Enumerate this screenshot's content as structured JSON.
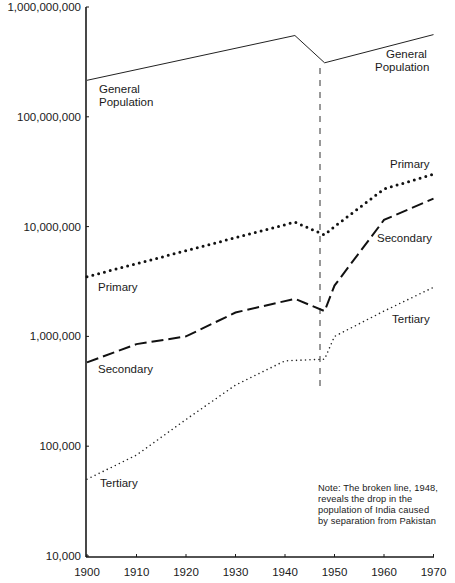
{
  "chart_data": {
    "type": "line",
    "title": "",
    "xlabel": "",
    "ylabel": "",
    "yscale": "log",
    "ylim": [
      10000,
      1000000000
    ],
    "xlim": [
      1900,
      1970
    ],
    "grid": false,
    "legend": "inline labels",
    "x_ticks": [
      "1900",
      "1910",
      "1920",
      "1930",
      "1940",
      "1950",
      "1960",
      "1970"
    ],
    "y_ticks": [
      "1,000,000,000",
      "100,000,000",
      "10,000,000",
      "1,000,000",
      "100,000",
      "10,000"
    ],
    "series": [
      {
        "name": "General Population",
        "style": "solid",
        "x": [
          1900,
          1942,
          1948,
          1970
        ],
        "values": [
          215000000,
          550000000,
          310000000,
          560000000
        ]
      },
      {
        "name": "Primary",
        "style": "dotted-heavy",
        "x": [
          1900,
          1942,
          1948,
          1950,
          1960,
          1970
        ],
        "values": [
          3500000,
          11000000,
          8400000,
          10000000,
          22000000,
          30000000
        ]
      },
      {
        "name": "Secondary",
        "style": "dashed",
        "x": [
          1900,
          1910,
          1920,
          1930,
          1942,
          1948,
          1950,
          1960,
          1970
        ],
        "values": [
          580000,
          850000,
          1000000,
          1650000,
          2200000,
          1700000,
          2900000,
          11500000,
          18000000
        ]
      },
      {
        "name": "Tertiary",
        "style": "dotted-light",
        "x": [
          1900,
          1910,
          1920,
          1930,
          1940,
          1948,
          1950,
          1960,
          1970
        ],
        "values": [
          50000,
          83000,
          175000,
          360000,
          600000,
          620000,
          1000000,
          1700000,
          2800000
        ]
      }
    ],
    "annotations": [
      {
        "type": "vertical-broken-line",
        "x": 1948
      },
      {
        "type": "note",
        "text": "Note: The broken line, 1948, reveals the drop in the population of India caused by separation from Pakistan"
      }
    ]
  },
  "labels": {
    "general_left": [
      "General",
      "Population"
    ],
    "general_right": [
      "General",
      "Population"
    ],
    "primary_left": "Primary",
    "primary_right": "Primary",
    "secondary_left": "Secondary",
    "secondary_right": "Secondary",
    "tertiary_left": "Tertiary",
    "tertiary_right": "Tertiary"
  },
  "note": {
    "lines": [
      "Note: The broken line, 1948,",
      "reveals the drop in the",
      "population of India caused",
      "by separation from Pakistan"
    ]
  }
}
